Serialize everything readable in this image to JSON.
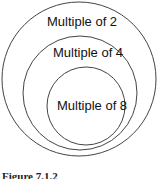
{
  "diagram": {
    "type": "nested-sets",
    "circles": [
      {
        "label": "Multiple of 2",
        "cx": 79,
        "cy": 79,
        "r": 77
      },
      {
        "label": "Multiple of 4",
        "cx": 80,
        "cy": 93,
        "r": 57
      },
      {
        "label": "Multiple of 8",
        "cx": 86,
        "cy": 106,
        "r": 39
      }
    ],
    "stroke_color": "#444444",
    "caption": "Figure 7.1.2"
  }
}
